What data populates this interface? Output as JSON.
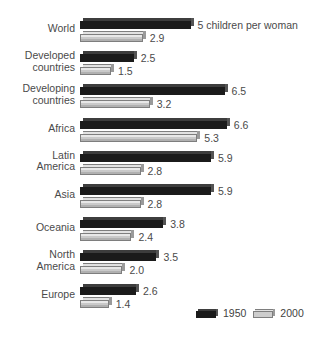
{
  "chart_data": {
    "type": "bar",
    "orientation": "horizontal",
    "title": "",
    "xlabel": "",
    "ylabel": "",
    "unit_note": "5 children per woman",
    "categories": [
      "World",
      "Developed countries",
      "Developing countries",
      "Africa",
      "Latin America",
      "Asia",
      "Oceania",
      "North America",
      "Europe"
    ],
    "series": [
      {
        "name": "1950",
        "color": "#1b1b1b",
        "values": [
          5,
          2.5,
          6.5,
          6.6,
          5.9,
          5.9,
          3.8,
          3.5,
          2.6
        ],
        "labels": [
          "5 children per woman",
          "2.5",
          "6.5",
          "6.6",
          "5.9",
          "5.9",
          "3.8",
          "3.5",
          "2.6"
        ]
      },
      {
        "name": "2000",
        "color": "#c9c9c9",
        "values": [
          2.9,
          1.5,
          3.2,
          5.3,
          2.8,
          2.8,
          2.4,
          2.0,
          1.4
        ],
        "labels": [
          "2.9",
          "1.5",
          "3.2",
          "5.3",
          "2.8",
          "2.8",
          "2.4",
          "2.0",
          "1.4"
        ]
      }
    ],
    "xlim": [
      0,
      6.6
    ],
    "grid": false,
    "legend_position": "bottom-right"
  },
  "rows": [
    {
      "label_line1": "World",
      "label_line2": ""
    },
    {
      "label_line1": "Developed",
      "label_line2": "countries"
    },
    {
      "label_line1": "Developing",
      "label_line2": "countries"
    },
    {
      "label_line1": "Africa",
      "label_line2": ""
    },
    {
      "label_line1": "Latin",
      "label_line2": "America"
    },
    {
      "label_line1": "Asia",
      "label_line2": ""
    },
    {
      "label_line1": "Oceania",
      "label_line2": ""
    },
    {
      "label_line1": "North",
      "label_line2": "America"
    },
    {
      "label_line1": "Europe",
      "label_line2": ""
    }
  ],
  "legend": {
    "items": [
      {
        "label": "1950"
      },
      {
        "label": "2000"
      }
    ]
  }
}
